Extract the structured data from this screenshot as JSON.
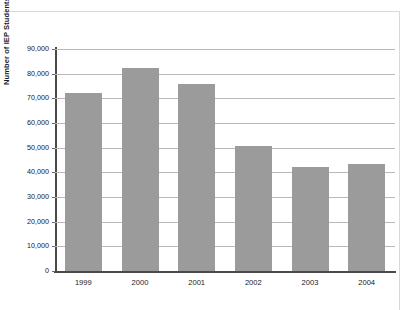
{
  "chart_data": {
    "type": "bar",
    "title": "",
    "subtitle": "",
    "xlabel": "",
    "ylabel": "Number of IEP Students",
    "categories": [
      "1999",
      "2000",
      "2001",
      "2002",
      "2003",
      "2004"
    ],
    "values": [
      72000,
      82500,
      76000,
      50500,
      42000,
      43500
    ],
    "series": [
      {
        "name": "Number of IEP Students",
        "values": [
          72000,
          82500,
          76000,
          50500,
          42000,
          43500
        ]
      }
    ],
    "ylim": [
      0,
      90000
    ],
    "ytick_values": [
      0,
      10000,
      20000,
      30000,
      40000,
      50000,
      60000,
      70000,
      80000,
      90000
    ],
    "ytick_labels": [
      "0",
      "10,000",
      "20,000",
      "30,000",
      "40,000",
      "50,000",
      "60,000",
      "70,000",
      "80,000",
      "90,000"
    ],
    "grid": true,
    "grid_axis": "y",
    "legend": false,
    "legend_position": "none",
    "bar_color": "#9b9b9b",
    "grid_color": "#b9b9b9",
    "axis_color": "#4a4a4a",
    "background_color": "#ffffff"
  }
}
